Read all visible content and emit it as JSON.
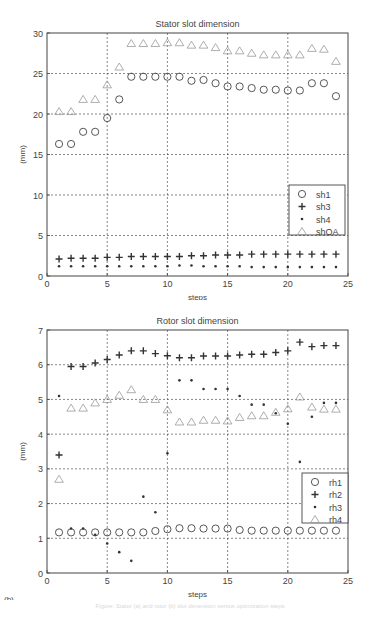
{
  "chart_data": [
    {
      "type": "scatter",
      "panel_label": "(a)",
      "title": "Stator slot dimension",
      "xlabel": "steps",
      "ylabel": "(mm)",
      "xlim": [
        0,
        25
      ],
      "ylim": [
        0,
        30
      ],
      "xticks": [
        0,
        5,
        10,
        15,
        20,
        25
      ],
      "yticks": [
        0,
        5,
        10,
        15,
        20,
        25,
        30
      ],
      "grid": true,
      "legend_position": "right-middle",
      "x": [
        1,
        2,
        3,
        4,
        5,
        6,
        7,
        8,
        9,
        10,
        11,
        12,
        13,
        14,
        15,
        16,
        17,
        18,
        19,
        20,
        21,
        22,
        23,
        24
      ],
      "series": [
        {
          "name": "sh1",
          "marker": "circle",
          "values": [
            16.3,
            16.3,
            17.8,
            17.8,
            19.5,
            21.8,
            24.6,
            24.6,
            24.6,
            24.6,
            24.6,
            24.1,
            24.2,
            23.8,
            23.4,
            23.4,
            23.2,
            23.0,
            23.0,
            22.9,
            22.9,
            23.8,
            23.8,
            22.2
          ]
        },
        {
          "name": "sh3",
          "marker": "plus",
          "values": [
            2.1,
            2.2,
            2.2,
            2.2,
            2.3,
            2.3,
            2.4,
            2.4,
            2.4,
            2.4,
            2.4,
            2.5,
            2.5,
            2.6,
            2.6,
            2.6,
            2.7,
            2.7,
            2.7,
            2.7,
            2.7,
            2.7,
            2.7,
            2.7
          ]
        },
        {
          "name": "sh4",
          "marker": "dot",
          "values": [
            1.2,
            1.2,
            1.2,
            1.2,
            1.2,
            1.2,
            1.2,
            1.2,
            1.2,
            1.2,
            1.3,
            1.3,
            1.2,
            1.2,
            1.2,
            1.2,
            1.1,
            1.1,
            1.1,
            1.1,
            1.1,
            1.1,
            1.1,
            1.1
          ]
        },
        {
          "name": "shOA",
          "marker": "triangle",
          "values": [
            20.3,
            20.3,
            21.8,
            21.8,
            23.6,
            25.8,
            28.7,
            28.7,
            28.7,
            28.8,
            28.8,
            28.5,
            28.5,
            28.2,
            27.8,
            27.8,
            27.5,
            27.3,
            27.3,
            27.3,
            27.3,
            28.1,
            28.0,
            26.5
          ]
        }
      ]
    },
    {
      "type": "scatter",
      "panel_label": "(b)",
      "title": "Rotor slot dimension",
      "xlabel": "steps",
      "ylabel": "(mm)",
      "xlim": [
        0,
        25
      ],
      "ylim": [
        0,
        7
      ],
      "xticks": [
        0,
        5,
        10,
        15,
        20,
        25
      ],
      "yticks": [
        0,
        1,
        2,
        3,
        4,
        5,
        6,
        7
      ],
      "grid": true,
      "legend_position": "right-middle",
      "x": [
        1,
        2,
        3,
        4,
        5,
        6,
        7,
        8,
        9,
        10,
        11,
        12,
        13,
        14,
        15,
        16,
        17,
        18,
        19,
        20,
        21,
        22,
        23,
        24
      ],
      "series": [
        {
          "name": "rh1",
          "marker": "circle",
          "values": [
            1.17,
            1.17,
            1.17,
            1.17,
            1.17,
            1.17,
            1.17,
            1.17,
            1.21,
            1.26,
            1.29,
            1.29,
            1.28,
            1.28,
            1.28,
            1.24,
            1.22,
            1.22,
            1.22,
            1.22,
            1.22,
            1.22,
            1.22,
            1.22
          ]
        },
        {
          "name": "rh2",
          "marker": "plus",
          "values": [
            3.4,
            5.95,
            5.95,
            6.05,
            6.15,
            6.28,
            6.4,
            6.4,
            6.32,
            6.26,
            6.2,
            6.2,
            6.25,
            6.25,
            6.25,
            6.28,
            6.3,
            6.3,
            6.35,
            6.4,
            6.65,
            6.52,
            6.55,
            6.55
          ]
        },
        {
          "name": "rh3",
          "marker": "dot",
          "values": [
            5.1,
            1.28,
            1.28,
            1.1,
            0.85,
            0.6,
            0.35,
            2.2,
            1.75,
            3.45,
            5.55,
            5.55,
            5.3,
            5.3,
            5.3,
            5.1,
            4.85,
            4.85,
            4.6,
            4.3,
            3.2,
            4.5,
            4.9,
            4.9
          ]
        },
        {
          "name": "rh4",
          "marker": "triangle",
          "values": [
            2.7,
            4.75,
            4.75,
            4.9,
            5.0,
            5.12,
            5.28,
            5.0,
            5.0,
            4.7,
            4.35,
            4.35,
            4.4,
            4.4,
            4.38,
            4.48,
            4.53,
            4.53,
            4.63,
            4.73,
            5.07,
            4.78,
            4.72,
            4.72
          ]
        }
      ]
    }
  ],
  "caption": "Figure: Stator (a) and rotor (b) slot dimension versus optimization steps"
}
